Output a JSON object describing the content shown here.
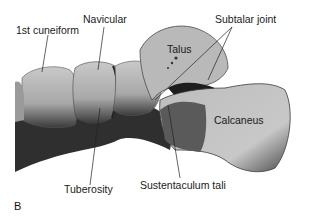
{
  "figure": {
    "panel_letter": "B",
    "labels": {
      "first_cuneiform": "1st cuneiform",
      "navicular": "Navicular",
      "subtalar_joint": "Subtalar joint",
      "talus": "Talus",
      "calcaneus": "Calcaneus",
      "tuberosity": "Tuberosity",
      "sustentaculum_tali": "Sustentaculum tali"
    }
  }
}
